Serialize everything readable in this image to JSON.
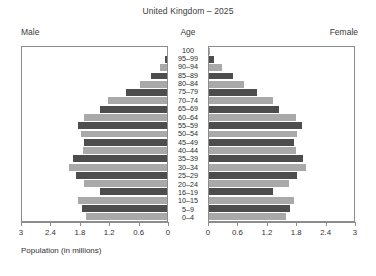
{
  "chart_data": {
    "type": "bar",
    "subtype": "population-pyramid",
    "title": "United Kingdom – 2025",
    "xlabel": "Population (in millions)",
    "ylabel": "Age",
    "left_label": "Male",
    "right_label": "Female",
    "xlim": [
      0,
      3
    ],
    "xticks": [
      3,
      2.4,
      1.8,
      1.2,
      0.6,
      0
    ],
    "xticklabels_left": [
      "3",
      "2.4",
      "1.8",
      "1.2",
      "0.6",
      "0"
    ],
    "xticklabels_right": [
      "0",
      "0.6",
      "1.2",
      "1.8",
      "2.4",
      "3"
    ],
    "grid": false,
    "legend": "none",
    "bar_color_light": "#a9a9a9",
    "bar_color_dark": "#4d4d4d",
    "categories": [
      "100",
      "95–99",
      "90–94",
      "85–89",
      "80–84",
      "75–79",
      "70–74",
      "65–69",
      "60–64",
      "55–59",
      "50–54",
      "45–49",
      "40–44",
      "35–39",
      "30–34",
      "25–29",
      "20–24",
      "16–19",
      "10–15",
      "5–9",
      "0–4"
    ],
    "series": [
      {
        "name": "Male",
        "side": "left",
        "values": [
          0.0,
          0.04,
          0.14,
          0.33,
          0.56,
          0.85,
          1.22,
          1.39,
          1.72,
          1.85,
          1.78,
          1.71,
          1.74,
          1.94,
          2.02,
          1.88,
          1.72,
          1.39,
          1.84,
          1.75,
          1.67
        ]
      },
      {
        "name": "Female",
        "side": "right",
        "values": [
          0.02,
          0.1,
          0.26,
          0.5,
          0.73,
          1.0,
          1.33,
          1.45,
          1.79,
          1.92,
          1.83,
          1.76,
          1.79,
          1.95,
          2.0,
          1.83,
          1.66,
          1.32,
          1.75,
          1.67,
          1.59
        ]
      }
    ]
  }
}
